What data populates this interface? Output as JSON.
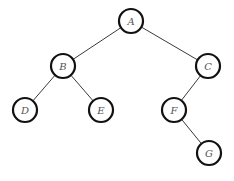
{
  "diagram": {
    "type": "binary-tree",
    "nodes": [
      {
        "id": "A",
        "label": "A",
        "x": 131,
        "y": 21
      },
      {
        "id": "B",
        "label": "B",
        "x": 63,
        "y": 66
      },
      {
        "id": "C",
        "label": "C",
        "x": 208,
        "y": 66
      },
      {
        "id": "D",
        "label": "D",
        "x": 25,
        "y": 110
      },
      {
        "id": "E",
        "label": "E",
        "x": 101,
        "y": 110
      },
      {
        "id": "F",
        "label": "F",
        "x": 174,
        "y": 110
      },
      {
        "id": "G",
        "label": "G",
        "x": 209,
        "y": 153
      }
    ],
    "edges": [
      {
        "from": "A",
        "to": "B"
      },
      {
        "from": "A",
        "to": "C"
      },
      {
        "from": "B",
        "to": "D"
      },
      {
        "from": "B",
        "to": "E"
      },
      {
        "from": "C",
        "to": "F"
      },
      {
        "from": "F",
        "to": "G"
      }
    ],
    "node_radius": 12
  }
}
